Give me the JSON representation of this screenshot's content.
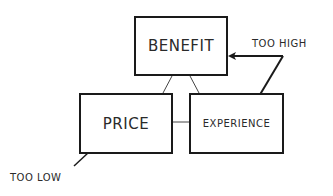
{
  "diagram": {
    "nodes": {
      "benefit": "BENEFIT",
      "price": "PRICE",
      "experience": "EXPERIENCE"
    },
    "annotations": {
      "too_high": "TOO HIGH",
      "too_low": "TOO LOW"
    },
    "edges": [
      [
        "BENEFIT",
        "PRICE"
      ],
      [
        "BENEFIT",
        "EXPERIENCE"
      ],
      [
        "PRICE",
        "EXPERIENCE"
      ]
    ],
    "arrows": [
      {
        "label": "TOO HIGH",
        "targets": [
          "BENEFIT",
          "EXPERIENCE"
        ]
      },
      {
        "label": "TOO LOW",
        "targets": [
          "PRICE"
        ]
      }
    ]
  },
  "colors": {
    "stroke": "#1a1a1a",
    "text": "#2a2a2a",
    "background": "#ffffff"
  }
}
